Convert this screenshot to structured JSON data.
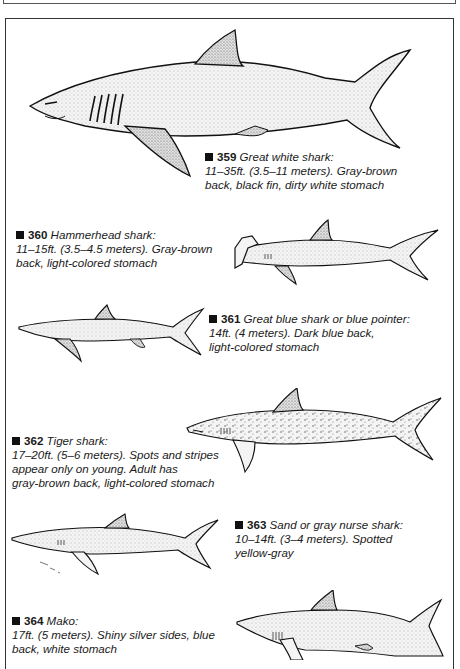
{
  "page": {
    "frame_color": "#333333",
    "shark_fill": "#e8e8e8",
    "shark_stroke": "#111111"
  },
  "entries": [
    {
      "number": "359",
      "name": "Great white shark:",
      "lines": [
        "11–35ft. (3.5–11 meters). Gray-brown",
        "back, black fin, dirty white stomach"
      ],
      "icon": "great-white-shark-illustration"
    },
    {
      "number": "360",
      "name": "Hammerhead shark:",
      "lines": [
        "11–15ft. (3.5–4.5 meters). Gray-brown",
        "back, light-colored stomach"
      ],
      "icon": "hammerhead-shark-illustration"
    },
    {
      "number": "361",
      "name": "Great blue shark or blue pointer:",
      "lines": [
        "14ft. (4 meters). Dark blue back,",
        "light-colored stomach"
      ],
      "icon": "blue-shark-illustration"
    },
    {
      "number": "362",
      "name": "Tiger shark:",
      "lines": [
        "17–20ft. (5–6 meters). Spots and stripes",
        "appear only on young. Adult has",
        "gray-brown back, light-colored stomach"
      ],
      "icon": "tiger-shark-illustration"
    },
    {
      "number": "363",
      "name": "Sand or gray nurse shark:",
      "lines": [
        "10–14ft. (3–4 meters). Spotted",
        "yellow-gray"
      ],
      "icon": "sand-shark-illustration"
    },
    {
      "number": "364",
      "name": "Mako:",
      "lines": [
        "17ft. (5 meters). Shiny silver sides, blue",
        "back, white stomach"
      ],
      "icon": "mako-shark-illustration"
    }
  ]
}
